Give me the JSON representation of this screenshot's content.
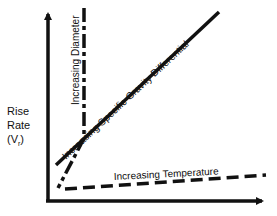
{
  "diagram": {
    "y_axis_label": {
      "line1": "Rise",
      "line2": "Rate",
      "symbol": "(V",
      "subscript": "r",
      "close": ")"
    },
    "lines": [
      {
        "id": "diameter",
        "label": "Increasing Diameter",
        "style": "dash-dot"
      },
      {
        "id": "specific-gravity",
        "label": "Increasing Specific Gravity Differential",
        "style": "solid"
      },
      {
        "id": "temperature",
        "label": "Increasing Temperature",
        "style": "dashed"
      }
    ],
    "colors": {
      "ink": "#111111",
      "background": "#ffffff"
    }
  }
}
